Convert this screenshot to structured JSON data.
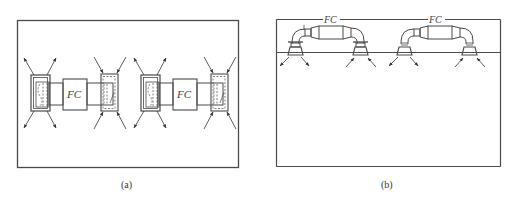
{
  "figure": {
    "panels": [
      {
        "id": "a",
        "caption": "(a)",
        "view": "plan",
        "units": [
          {
            "label": "FC",
            "supply_side": "left",
            "return_side": "right"
          },
          {
            "label": "FC",
            "supply_side": "left",
            "return_side": "right"
          }
        ]
      },
      {
        "id": "b",
        "caption": "(b)",
        "view": "section",
        "units": [
          {
            "label": "FC",
            "supply_side": "left",
            "return_side": "right"
          },
          {
            "label": "FC",
            "supply_side": "left",
            "return_side": "right"
          }
        ]
      }
    ],
    "colors": {
      "line": "#4a4a4a",
      "background": "#ffffff"
    }
  }
}
